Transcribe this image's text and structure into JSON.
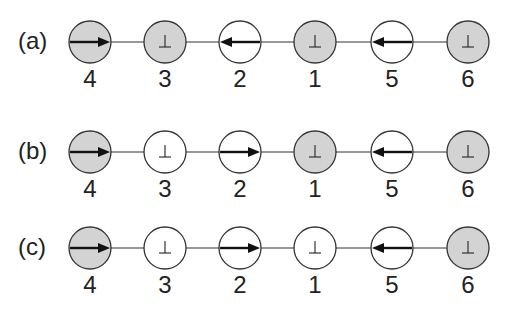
{
  "figure": {
    "colors": {
      "shaded_fill": "#d3d3d3",
      "open_fill": "#ffffff",
      "stroke": "#333333",
      "arrow": "#111111"
    },
    "node_x": [
      90,
      165,
      240,
      315,
      392,
      468
    ],
    "rows": [
      {
        "label": "(a)",
        "y": 42,
        "nodes": [
          {
            "id": "4",
            "shaded": true,
            "symbol": "arrow-right"
          },
          {
            "id": "3",
            "shaded": true,
            "symbol": "perp"
          },
          {
            "id": "2",
            "shaded": false,
            "symbol": "arrow-left"
          },
          {
            "id": "1",
            "shaded": true,
            "symbol": "perp"
          },
          {
            "id": "5",
            "shaded": false,
            "symbol": "arrow-left"
          },
          {
            "id": "6",
            "shaded": true,
            "symbol": "perp"
          }
        ]
      },
      {
        "label": "(b)",
        "y": 152,
        "nodes": [
          {
            "id": "4",
            "shaded": true,
            "symbol": "arrow-right"
          },
          {
            "id": "3",
            "shaded": false,
            "symbol": "perp"
          },
          {
            "id": "2",
            "shaded": false,
            "symbol": "arrow-right"
          },
          {
            "id": "1",
            "shaded": true,
            "symbol": "perp"
          },
          {
            "id": "5",
            "shaded": false,
            "symbol": "arrow-left"
          },
          {
            "id": "6",
            "shaded": true,
            "symbol": "perp"
          }
        ]
      },
      {
        "label": "(c)",
        "y": 248,
        "nodes": [
          {
            "id": "4",
            "shaded": true,
            "symbol": "arrow-right"
          },
          {
            "id": "3",
            "shaded": false,
            "symbol": "perp"
          },
          {
            "id": "2",
            "shaded": false,
            "symbol": "arrow-right"
          },
          {
            "id": "1",
            "shaded": false,
            "symbol": "perp"
          },
          {
            "id": "5",
            "shaded": false,
            "symbol": "arrow-left"
          },
          {
            "id": "6",
            "shaded": true,
            "symbol": "perp"
          }
        ]
      }
    ]
  }
}
